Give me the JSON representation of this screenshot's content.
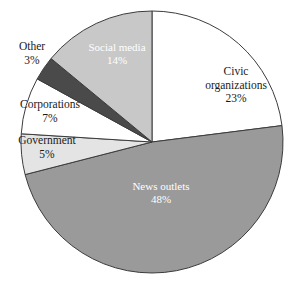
{
  "chart_data": {
    "type": "pie",
    "title": "",
    "subtitle": "",
    "xlabel": "",
    "ylabel": "",
    "legend_position": "none",
    "grid": false,
    "labels_inline": true,
    "units": "percent",
    "total": 100,
    "start_angle_deg": 0,
    "direction": "clockwise",
    "categories": [
      "Civic organizations",
      "News outlets",
      "Government",
      "Corporations",
      "Other",
      "Social media"
    ],
    "values": [
      23,
      48,
      5,
      7,
      3,
      14
    ],
    "slices": [
      {
        "name": "Civic organizations",
        "value": 23,
        "value_text": "23%",
        "label_line1": "Civic",
        "label_line2": "organizations",
        "color": "#ffffff",
        "stroke": "#3c3c3c",
        "label_color": "dark",
        "label_placement": "inside"
      },
      {
        "name": "News outlets",
        "value": 48,
        "value_text": "48%",
        "label_line1": "News outlets",
        "label_line2": "",
        "color": "#9a9a9a",
        "stroke": "#3c3c3c",
        "label_color": "light",
        "label_placement": "inside"
      },
      {
        "name": "Government",
        "value": 5,
        "value_text": "5%",
        "label_line1": "Government",
        "label_line2": "",
        "color": "#e4e4e4",
        "stroke": "#3c3c3c",
        "label_color": "dark",
        "label_placement": "outside"
      },
      {
        "name": "Corporations",
        "value": 7,
        "value_text": "7%",
        "label_line1": "Corporations",
        "label_line2": "",
        "color": "#ffffff",
        "stroke": "#3c3c3c",
        "label_color": "dark",
        "label_placement": "outside"
      },
      {
        "name": "Other",
        "value": 3,
        "value_text": "3%",
        "label_line1": "Other",
        "label_line2": "",
        "color": "#4a4a4a",
        "stroke": "#3c3c3c",
        "label_color": "dark",
        "label_placement": "outside"
      },
      {
        "name": "Social media",
        "value": 14,
        "value_text": "14%",
        "label_line1": "Social media",
        "label_line2": "",
        "color": "#c8c8c8",
        "stroke": "#3c3c3c",
        "label_color": "light",
        "label_placement": "inside"
      }
    ]
  },
  "colors": {
    "background": "#ffffff",
    "outline": "#3c3c3c",
    "text_dark": "#1a1a1a",
    "text_light": "#ffffff"
  },
  "geometry": {
    "center_x": 152,
    "center_y": 142,
    "radius": 131
  }
}
